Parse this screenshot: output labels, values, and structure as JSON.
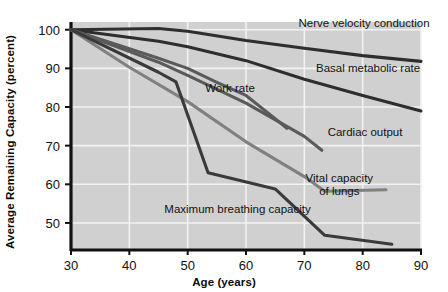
{
  "chart_data": {
    "type": "line",
    "title": "",
    "xlabel": "Age (years)",
    "ylabel": "Average Remaining Capacity (percent)",
    "xlim": [
      30,
      90
    ],
    "ylim": [
      43,
      102
    ],
    "xticks": [
      30,
      40,
      50,
      60,
      70,
      80,
      90
    ],
    "xtick_labels": [
      "30",
      "40",
      "50",
      "60",
      "70",
      "80",
      "90"
    ],
    "yticks": [
      50,
      60,
      70,
      80,
      90,
      100
    ],
    "ytick_labels": [
      "50",
      "60",
      "70",
      "80",
      "90",
      "100"
    ],
    "grid": true,
    "grid_color": "#f2f2f2",
    "plot_background": "#d0d0d0",
    "legend_position": "inline-annotations",
    "series": [
      {
        "name": "Nerve velocity conduction",
        "color": "#2e2e2e",
        "label_x": 69,
        "label_y": 100.8,
        "points": [
          {
            "x": 30,
            "y": 100.0
          },
          {
            "x": 45,
            "y": 100.3
          },
          {
            "x": 50,
            "y": 99.6
          },
          {
            "x": 60,
            "y": 97.2
          },
          {
            "x": 70,
            "y": 95.2
          },
          {
            "x": 80,
            "y": 93.3
          },
          {
            "x": 90,
            "y": 91.8
          }
        ]
      },
      {
        "name": "Basal metabolic rate",
        "color": "#2e2e2e",
        "label_x": 72,
        "label_y": 89.0,
        "points": [
          {
            "x": 30,
            "y": 100.0
          },
          {
            "x": 45,
            "y": 97.0
          },
          {
            "x": 50,
            "y": 95.6
          },
          {
            "x": 60,
            "y": 92.0
          },
          {
            "x": 70,
            "y": 87.2
          },
          {
            "x": 80,
            "y": 83.0
          },
          {
            "x": 90,
            "y": 79.0
          }
        ]
      },
      {
        "name": "Work rate",
        "color": "#5a5a5a",
        "label_x": 53,
        "label_y": 83.8,
        "points": [
          {
            "x": 30,
            "y": 100.0
          },
          {
            "x": 45,
            "y": 92.6
          },
          {
            "x": 50,
            "y": 90.0
          },
          {
            "x": 55,
            "y": 86.4
          },
          {
            "x": 60,
            "y": 83.0
          },
          {
            "x": 65,
            "y": 77.0
          },
          {
            "x": 67,
            "y": 74.5
          }
        ]
      },
      {
        "name": "Cardiac output",
        "color": "#5a5a5a",
        "label_x": 74,
        "label_y": 72.5,
        "points": [
          {
            "x": 30,
            "y": 100.0
          },
          {
            "x": 45,
            "y": 91.6
          },
          {
            "x": 50,
            "y": 88.2
          },
          {
            "x": 60,
            "y": 81.0
          },
          {
            "x": 70,
            "y": 72.4
          },
          {
            "x": 73,
            "y": 68.8
          }
        ]
      },
      {
        "name": "Vital capacity of lungs",
        "color": "#808080",
        "label_x": 76,
        "label_y": 60.5,
        "points": [
          {
            "x": 30,
            "y": 100.0
          },
          {
            "x": 40,
            "y": 90.3
          },
          {
            "x": 50,
            "y": 81.4
          },
          {
            "x": 60,
            "y": 71.0
          },
          {
            "x": 70,
            "y": 62.0
          },
          {
            "x": 73.5,
            "y": 58.2
          },
          {
            "x": 84,
            "y": 58.6
          }
        ]
      },
      {
        "name": "Maximum breathing capacity",
        "color": "#3a3a3a",
        "label_x": 46,
        "label_y": 52.5,
        "points": [
          {
            "x": 30,
            "y": 100.0
          },
          {
            "x": 45,
            "y": 89.0
          },
          {
            "x": 48,
            "y": 86.5
          },
          {
            "x": 53.5,
            "y": 63.0
          },
          {
            "x": 65,
            "y": 58.8
          },
          {
            "x": 73.5,
            "y": 46.8
          },
          {
            "x": 85,
            "y": 44.5
          }
        ]
      }
    ]
  }
}
